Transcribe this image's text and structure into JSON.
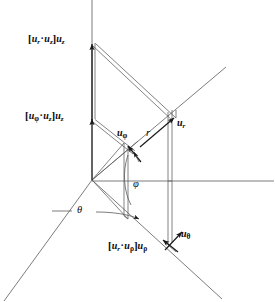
{
  "figure": {
    "background_color": "#ffffff",
    "line_color": "#4a4a4a",
    "text_color": "#0a0a0a",
    "width": 275,
    "height": 302
  },
  "labels": {
    "ur_dot_uz_uz": {
      "text": "[u_r·u_z]u_z",
      "bracket_open": "[",
      "bracket_close": "]",
      "vec1": "u",
      "sub1": "r",
      "dot": "·",
      "vec2": "u",
      "sub2": "z",
      "vec3": "u",
      "sub3": "z",
      "x": 28,
      "y": 38
    },
    "uphi_dot_uz_uz": {
      "text": "[u_φ·u_z]u_z",
      "bracket_open": "[",
      "bracket_close": "]",
      "vec1": "u",
      "sub1": "φ",
      "dot": "·",
      "vec2": "u",
      "sub2": "z",
      "vec3": "u",
      "sub3": "z",
      "x": 25,
      "y": 115
    },
    "ur_dot_urho_urho": {
      "text": "[u_r·u_ρ]u_ρ",
      "bracket_open": "[",
      "bracket_close": "]",
      "vec1": "u",
      "sub1": "r",
      "dot": "·",
      "vec2": "u",
      "sub2": "ρ",
      "vec3": "u",
      "sub3": "ρ",
      "x": 108,
      "y": 243
    },
    "u_r": {
      "vec": "u",
      "sub": "r",
      "x": 177,
      "y": 123
    },
    "u_phi": {
      "vec": "u",
      "sub": "φ",
      "x": 117,
      "y": 133
    },
    "u_theta": {
      "vec": "u",
      "sub": "θ",
      "x": 181,
      "y": 234
    },
    "r": {
      "text": "r",
      "x": 146,
      "y": 133
    },
    "phi": {
      "text": "φ",
      "x": 133,
      "y": 184
    },
    "theta": {
      "text": "θ",
      "x": 77,
      "y": 212
    }
  },
  "geometry": {
    "origin": {
      "x": 92,
      "y": 180
    },
    "z_axis": {
      "x1": 92,
      "y1": 0,
      "x2": 92,
      "y2": 180
    },
    "rho_axis_left": {
      "x1": 92,
      "y1": 180,
      "x2": 4,
      "y2": 301
    },
    "rho_axis_right": {
      "x1": 92,
      "y1": 180,
      "x2": 222,
      "y2": 298
    },
    "horizontal_axis": {
      "x1": 92,
      "y1": 180,
      "x2": 274,
      "y2": 181
    },
    "r_axis": {
      "x1": 92,
      "y1": 180,
      "x2": 225,
      "y2": 68
    },
    "ur_point": {
      "x": 172,
      "y": 120
    },
    "uphi_point": {
      "x": 133,
      "y": 152
    },
    "z_arrow_top": {
      "x": 92,
      "y": 45
    },
    "z_arrow_mid": {
      "x": 92,
      "y": 121
    }
  }
}
